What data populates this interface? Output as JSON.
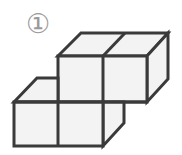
{
  "figure": {
    "label": "①",
    "cube_count": 4,
    "colors": {
      "stroke": "#3a3a3a",
      "fill": "#f3f3f3",
      "label": "#9a9a9a",
      "background": "#ffffff"
    }
  }
}
